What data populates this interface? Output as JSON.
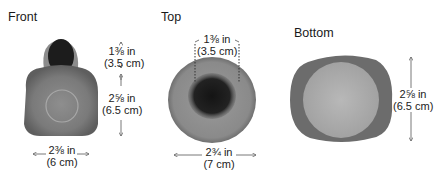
{
  "views": [
    {
      "label": "Front",
      "dimensions": [
        {
          "imperial": "1⅜ in",
          "metric": "(3.5 cm)",
          "orientation": "vertical",
          "measures": "head height"
        },
        {
          "imperial": "2⅝ in",
          "metric": "(6.5 cm)",
          "orientation": "vertical",
          "measures": "body height"
        },
        {
          "imperial": "2⅜ in",
          "metric": "(6 cm)",
          "orientation": "horizontal",
          "measures": "width"
        }
      ]
    },
    {
      "label": "Top",
      "dimensions": [
        {
          "imperial": "1⅜ in",
          "metric": "(3.5 cm)",
          "orientation": "horizontal",
          "measures": "head diameter"
        },
        {
          "imperial": "2¾ in",
          "metric": "(7 cm)",
          "orientation": "horizontal",
          "measures": "body diameter"
        }
      ]
    },
    {
      "label": "Bottom",
      "dimensions": [
        {
          "imperial": "2⅝ in",
          "metric": "(6.5 cm)",
          "orientation": "vertical",
          "measures": "base diameter"
        }
      ]
    }
  ],
  "colors": {
    "fur_gray": "#8a8a8a",
    "fur_light": "#b5b5b5",
    "head_black": "#1c1c1c",
    "arrow": "#555555"
  }
}
